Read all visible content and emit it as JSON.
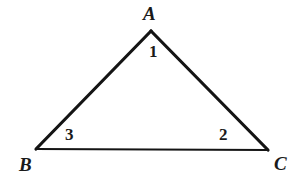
{
  "figure": {
    "background_color": "#ffffff",
    "stroke_color": "#141414",
    "vertices": {
      "A": {
        "label": "A",
        "x": 151,
        "y": 31
      },
      "B": {
        "label": "B",
        "x": 36,
        "y": 149
      },
      "C": {
        "label": "C",
        "x": 268,
        "y": 150
      }
    },
    "angles": {
      "at_A": {
        "label": "1"
      },
      "at_C": {
        "label": "2"
      },
      "at_B": {
        "label": "3"
      }
    },
    "sides": [
      {
        "name": "AB",
        "from": "A",
        "to": "B",
        "stroke_width": 3.2
      },
      {
        "name": "AC",
        "from": "A",
        "to": "C",
        "stroke_width": 3.2
      },
      {
        "name": "BC",
        "from": "B",
        "to": "C",
        "stroke_width": 2.0
      }
    ]
  }
}
